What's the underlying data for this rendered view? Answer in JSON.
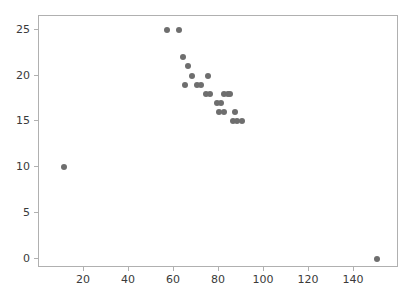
{
  "chart_data": {
    "type": "scatter",
    "title": "",
    "xlabel": "",
    "ylabel": "",
    "xlim": [
      0,
      160
    ],
    "ylim": [
      -1,
      26.5
    ],
    "grid": false,
    "legend": null,
    "marker": {
      "shape": "circle",
      "color": "#6e6e6e",
      "size_px": 6
    },
    "xticks": [
      20,
      40,
      60,
      80,
      100,
      120,
      140
    ],
    "yticks": [
      0,
      5,
      10,
      15,
      20,
      25
    ],
    "xtick_labels": [
      "20",
      "40",
      "60",
      "80",
      "100",
      "120",
      "140"
    ],
    "ytick_labels": [
      "0",
      "5",
      "10",
      "15",
      "20",
      "25"
    ],
    "n_points": 24,
    "points": [
      {
        "x": 11,
        "y": 10
      },
      {
        "x": 57,
        "y": 25
      },
      {
        "x": 62,
        "y": 25
      },
      {
        "x": 64,
        "y": 22
      },
      {
        "x": 66,
        "y": 21
      },
      {
        "x": 65,
        "y": 19
      },
      {
        "x": 68,
        "y": 20
      },
      {
        "x": 70,
        "y": 19
      },
      {
        "x": 72,
        "y": 19
      },
      {
        "x": 75,
        "y": 20
      },
      {
        "x": 74,
        "y": 18
      },
      {
        "x": 76,
        "y": 18
      },
      {
        "x": 79,
        "y": 17
      },
      {
        "x": 81,
        "y": 17
      },
      {
        "x": 82,
        "y": 18
      },
      {
        "x": 84,
        "y": 18
      },
      {
        "x": 80,
        "y": 16
      },
      {
        "x": 82,
        "y": 16
      },
      {
        "x": 86,
        "y": 15
      },
      {
        "x": 88,
        "y": 15
      },
      {
        "x": 90,
        "y": 15
      },
      {
        "x": 87,
        "y": 16
      },
      {
        "x": 85,
        "y": 18
      },
      {
        "x": 150,
        "y": 0
      }
    ]
  },
  "axes": {
    "frame_color": "#b0b0b0",
    "tick_color": "#b0b0b0",
    "label_color": "#3a3a3a"
  }
}
